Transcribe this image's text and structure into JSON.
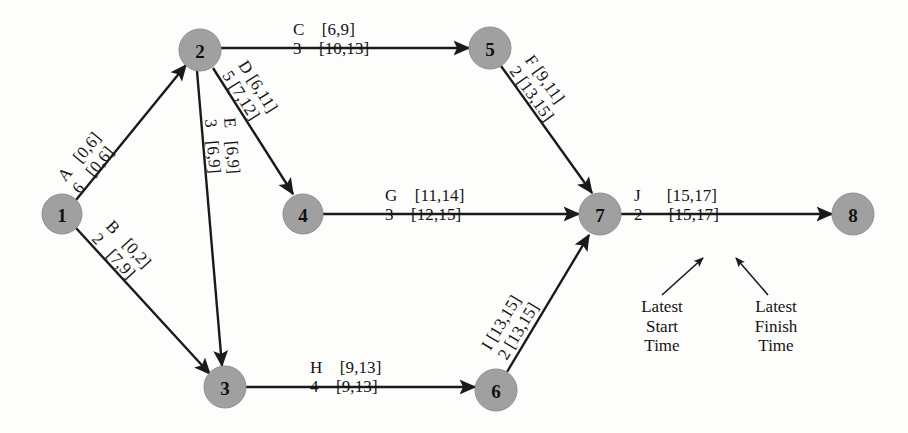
{
  "diagram": {
    "node_fill": "#a0a0a0",
    "edge_color": "#1a1a1a",
    "background": "#fdfdfc",
    "nodes": [
      {
        "id": "1",
        "label": "1",
        "cx": 62,
        "cy": 214,
        "r": 20
      },
      {
        "id": "2",
        "label": "2",
        "cx": 200,
        "cy": 50,
        "r": 21
      },
      {
        "id": "3",
        "label": "3",
        "cx": 225,
        "cy": 387,
        "r": 21
      },
      {
        "id": "4",
        "label": "4",
        "cx": 303,
        "cy": 214,
        "r": 20
      },
      {
        "id": "5",
        "label": "5",
        "cx": 490,
        "cy": 48,
        "r": 21
      },
      {
        "id": "6",
        "label": "6",
        "cx": 496,
        "cy": 390,
        "r": 21
      },
      {
        "id": "7",
        "label": "7",
        "cx": 600,
        "cy": 214,
        "r": 21
      },
      {
        "id": "8",
        "label": "8",
        "cx": 853,
        "cy": 214,
        "r": 21
      }
    ],
    "edges": [
      {
        "id": "A",
        "from": "1",
        "to": "2",
        "activity": "A",
        "duration": "6",
        "earliest": "[0,6]",
        "latest": "[0,6]",
        "top_row": "A   [0,6]",
        "bottom_row": "6   [0,6]"
      },
      {
        "id": "B",
        "from": "1",
        "to": "3",
        "activity": "B",
        "duration": "2",
        "earliest": "[0,2]",
        "latest": "[7,9]",
        "top_row": "B   [0,2]",
        "bottom_row": "2   [7,9]"
      },
      {
        "id": "C",
        "from": "2",
        "to": "5",
        "activity": "C",
        "duration": "3",
        "earliest": "[6,9]",
        "latest": "[10,13]",
        "top_row": "C    [6,9]",
        "bottom_row": "3    [10,13]"
      },
      {
        "id": "D",
        "from": "2",
        "to": "4",
        "activity": "D",
        "duration": "5",
        "earliest": "[6,11]",
        "latest": "[7,12]",
        "top_row": "D [6,11]",
        "bottom_row": "5 [7,12]"
      },
      {
        "id": "E",
        "from": "2",
        "to": "3",
        "activity": "E",
        "duration": "3",
        "earliest": "[6,9]",
        "latest": "[6,9]",
        "top_row": "E   [6,9]",
        "bottom_row": "3   [6,9]"
      },
      {
        "id": "F",
        "from": "5",
        "to": "7",
        "activity": "F",
        "duration": "2",
        "earliest": "[9,11]",
        "latest": "[13,15]",
        "top_row": "F [9,11]",
        "bottom_row": "2 [13,15]"
      },
      {
        "id": "G",
        "from": "4",
        "to": "7",
        "activity": "G",
        "duration": "3",
        "earliest": "[11,14]",
        "latest": "[12,15]",
        "top_row": "G    [11,14]",
        "bottom_row": "3    [12,15]"
      },
      {
        "id": "H",
        "from": "3",
        "to": "6",
        "activity": "H",
        "duration": "4",
        "earliest": "[9,13]",
        "latest": "[9,13]",
        "top_row": "H    [9,13]",
        "bottom_row": "4    [9,13]"
      },
      {
        "id": "I",
        "from": "6",
        "to": "7",
        "activity": "I",
        "duration": "2",
        "earliest": "[13,15]",
        "latest": "[13,15]",
        "top_row": "I [13,15]",
        "bottom_row": "2 [13,15]"
      },
      {
        "id": "J",
        "from": "7",
        "to": "8",
        "activity": "J",
        "duration": "2",
        "earliest": "[15,17]",
        "latest": "[15,17]",
        "top_row": "J      [15,17]",
        "bottom_row": "2      [15,17]"
      }
    ],
    "annotations": [
      {
        "id": "latest-start",
        "line1": "Latest",
        "line2": "Start",
        "line3": "Time"
      },
      {
        "id": "latest-finish",
        "line1": "Latest",
        "line2": "Finish",
        "line3": "Time"
      }
    ]
  }
}
